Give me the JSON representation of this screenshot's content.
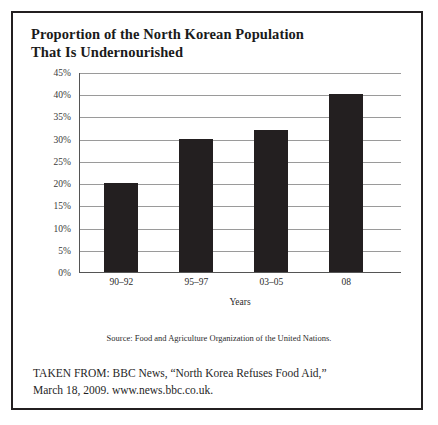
{
  "title": {
    "line1": "Proportion of the North Korean Population",
    "line2": "That Is Undernourished"
  },
  "source_note": "Source: Food and Agriculture Organization of the United Nations.",
  "citation": {
    "line1": "TAKEN FROM: BBC News, “North Korea Refuses Food Aid,”",
    "line2": "March 18, 2009. www.news.bbc.co.uk."
  },
  "colors": {
    "bar": "#231f20",
    "gridline": "#9a9a9a",
    "axis": "#555555",
    "border": "#231f20",
    "text": "#231f20"
  },
  "chart_data": {
    "type": "bar",
    "title": "Proportion of the North Korean Population That Is Undernourished",
    "categories": [
      "90–92",
      "95–97",
      "03–05",
      "08"
    ],
    "values": [
      20,
      30,
      32,
      40
    ],
    "xlabel": "Years",
    "ylabel": "",
    "ylim": [
      0,
      45
    ],
    "ytick_labels": [
      "45%",
      "40%",
      "35%",
      "30%",
      "25%",
      "20%",
      "15%",
      "10%",
      "5%",
      "0%"
    ],
    "ytick_values": [
      45,
      40,
      35,
      30,
      25,
      20,
      15,
      10,
      5,
      0
    ],
    "grid": true,
    "legend": false,
    "value_format": "percent"
  }
}
